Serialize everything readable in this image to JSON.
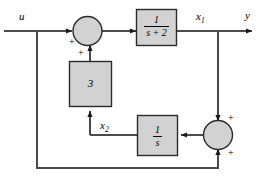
{
  "diagram": {
    "type": "control-system-block-diagram",
    "colors": {
      "block_fill": "#d2d2d2",
      "block_stroke": "#2b2b2b",
      "line": "#4a4a4a",
      "text": "#000000",
      "background": "#ffffff"
    },
    "signals": {
      "input": "u",
      "state_1": "x",
      "state_1_sub": "1",
      "state_2": "x",
      "state_2_sub": "2",
      "output": "y"
    },
    "blocks": [
      {
        "name": "first-order-lag",
        "numerator": "1",
        "denominator": "s + 2",
        "label": "1/(s + 2)"
      },
      {
        "name": "gain",
        "label": "3"
      },
      {
        "name": "integrator",
        "numerator": "1",
        "denominator": "s",
        "label": "1/s"
      }
    ],
    "summing_junctions": [
      {
        "name": "input-summer",
        "signs": [
          "+",
          "+"
        ]
      },
      {
        "name": "feedback-summer",
        "signs": [
          "+",
          "+"
        ]
      }
    ],
    "signs": {
      "summer1_left": "+",
      "summer1_bottom": "+",
      "summer2_top": "+",
      "summer2_bottom": "+"
    }
  }
}
